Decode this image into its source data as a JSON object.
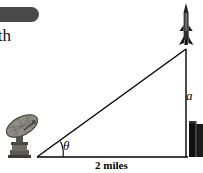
{
  "figure": {
    "type": "right-triangle-trigonometry-diagram",
    "title_fragment": "ith",
    "labels": {
      "vertical_side": "a",
      "angle": "θ",
      "base": "2 miles"
    },
    "objects": {
      "left_vertex": "satellite-dish",
      "top_vertex": "rocket",
      "right_vertex": "building-tower"
    },
    "colors": {
      "line": "#000000",
      "pill": "#4a4a4a",
      "dish_body": "#8a8880",
      "dish_dark": "#4f4d47",
      "building": "#141414",
      "rocket": "#1a1a1a",
      "background": "#ffffff"
    },
    "geometry": {
      "base_y": 157,
      "left_x": 37,
      "right_x": 186,
      "apex_y": 49,
      "angle_arc_radius": 26
    }
  }
}
